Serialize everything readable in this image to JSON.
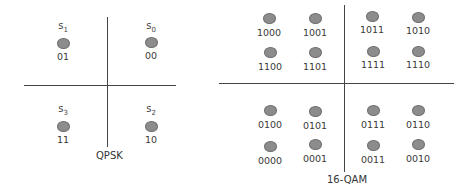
{
  "qpsk": {
    "title": "QPSK",
    "points": [
      {
        "symbol": "s",
        "sub": "1",
        "bits": "01"
      },
      {
        "symbol": "s",
        "sub": "0",
        "bits": "00"
      },
      {
        "symbol": "s",
        "sub": "3",
        "bits": "11"
      },
      {
        "symbol": "s",
        "sub": "2",
        "bits": "10"
      }
    ]
  },
  "qam16": {
    "title": "16-QAM",
    "points": [
      {
        "bits": "1000"
      },
      {
        "bits": "1001"
      },
      {
        "bits": "1011"
      },
      {
        "bits": "1010"
      },
      {
        "bits": "1100"
      },
      {
        "bits": "1101"
      },
      {
        "bits": "1111"
      },
      {
        "bits": "1110"
      },
      {
        "bits": "0100"
      },
      {
        "bits": "0101"
      },
      {
        "bits": "0111"
      },
      {
        "bits": "0110"
      },
      {
        "bits": "0000"
      },
      {
        "bits": "0001"
      },
      {
        "bits": "0011"
      },
      {
        "bits": "0010"
      }
    ]
  },
  "colors": {
    "dot": "#8c8c8c",
    "axis": "#444444"
  }
}
